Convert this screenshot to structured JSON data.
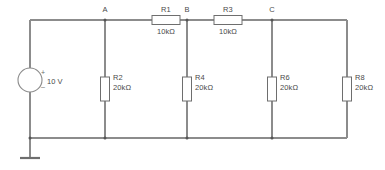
{
  "diagram": {
    "kind": "electrical-circuit-schematic",
    "colors": {
      "wire": "#8c8c8c",
      "component_outline": "#6e6e6e",
      "text": "#4a4a4a",
      "background": "#ffffff"
    }
  },
  "source": {
    "name": "voltage-source",
    "symbol": "circle",
    "value": "10 V",
    "plus_sign": "+",
    "minus_sign": "_"
  },
  "ground": {
    "name": "ground",
    "symbol": "earth-bar"
  },
  "nodes": [
    {
      "id": "A",
      "label": "A",
      "x": 105
    },
    {
      "id": "B",
      "label": "B",
      "x": 187
    },
    {
      "id": "C",
      "label": "C",
      "x": 272
    }
  ],
  "series_resistors": [
    {
      "ref": "R1",
      "value": "10kΩ",
      "orientation": "horizontal",
      "between": [
        "A",
        "B"
      ]
    },
    {
      "ref": "R3",
      "value": "10kΩ",
      "orientation": "horizontal",
      "between": [
        "B",
        "C"
      ]
    }
  ],
  "shunt_resistors": [
    {
      "ref": "R2",
      "value": "20kΩ",
      "orientation": "vertical",
      "node": "A"
    },
    {
      "ref": "R4",
      "value": "20kΩ",
      "orientation": "vertical",
      "node": "B"
    },
    {
      "ref": "R6",
      "value": "20kΩ",
      "orientation": "vertical",
      "node": "C"
    },
    {
      "ref": "R8",
      "value": "20kΩ",
      "orientation": "vertical",
      "node": "right-rail"
    }
  ]
}
